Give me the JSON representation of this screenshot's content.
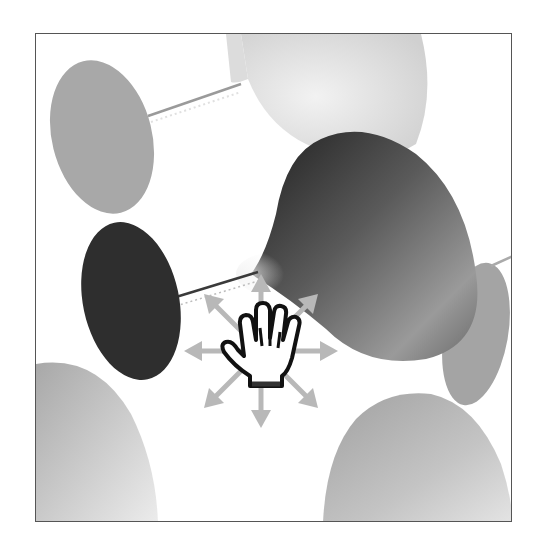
{
  "viewport": {
    "label": "3D viewport",
    "border_color": "#555555",
    "background": "#ffffff"
  },
  "scene": {
    "objects": [
      {
        "name": "upper-left-disc",
        "fill": "#a8a8a8"
      },
      {
        "name": "upper-right-cone",
        "fill_light": "#e6e6e6",
        "fill_dark": "#c8c8c8"
      },
      {
        "name": "center-cone",
        "fill_dark": "#2a2a2a",
        "fill_light": "#d8d8d8"
      },
      {
        "name": "center-left-disc",
        "fill": "#2e2e2e"
      },
      {
        "name": "right-back-disc",
        "fill": "#a0a0a0"
      },
      {
        "name": "bottom-left-cone",
        "fill_dark": "#b4b4b4",
        "fill_light": "#e8e8e8"
      },
      {
        "name": "bottom-right-cone",
        "fill_dark": "#a8a8a8",
        "fill_light": "#e0e0e0"
      }
    ]
  },
  "cursor": {
    "type": "pan-hand",
    "icon": "hand-icon",
    "arrows": [
      "up",
      "up-right",
      "right",
      "down-right",
      "down",
      "down-left",
      "left",
      "up-left"
    ],
    "arrow_color": "#b8b8b8"
  }
}
